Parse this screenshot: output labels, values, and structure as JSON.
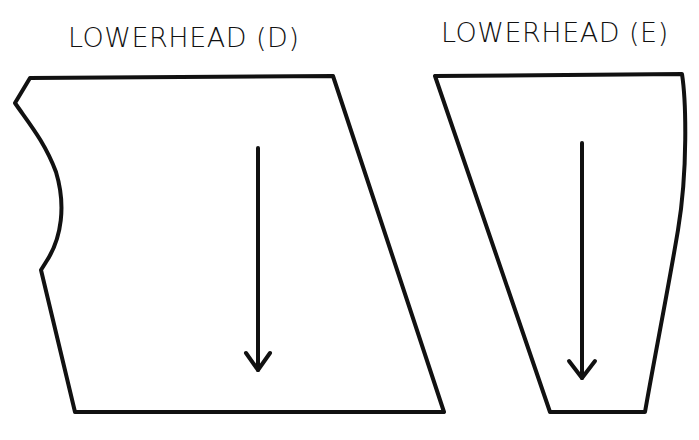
{
  "pieces": [
    {
      "id": "D",
      "label": "LOWERHEAD (D)",
      "shape": "quadrilateral with notched concave-curved left edge",
      "grainline": "downward arrow"
    },
    {
      "id": "E",
      "label": "LOWERHEAD (E)",
      "shape": "tapered trapezoid with curved right edge",
      "grainline": "downward arrow"
    }
  ],
  "colors": {
    "line": "#111111",
    "background": "#ffffff"
  }
}
